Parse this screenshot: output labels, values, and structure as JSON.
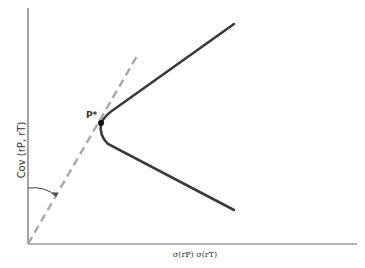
{
  "diagram": {
    "y_axis_label": "Cov (rP, rT)",
    "x_axis_label": "σ(rP) σ(rT)",
    "point_label": "P*",
    "colors": {
      "axis": "#555555",
      "curve": "#3a3a3a",
      "dashed_line": "#a8a8a8",
      "point": "#111111",
      "text": "#333333"
    },
    "elements": [
      {
        "type": "axis",
        "name": "y-axis",
        "from": [
          28,
          8
        ],
        "to": [
          28,
          244
        ]
      },
      {
        "type": "axis",
        "name": "x-axis",
        "from": [
          28,
          244
        ],
        "to": [
          357,
          244
        ]
      },
      {
        "type": "dashed-line",
        "name": "tangent-ray",
        "from": [
          28,
          244
        ],
        "to": [
          137,
          56
        ]
      },
      {
        "type": "curve",
        "name": "upper-branch",
        "from": [
          101,
          123
        ],
        "to": [
          234,
          24
        ]
      },
      {
        "type": "curve",
        "name": "lower-branch",
        "from": [
          101,
          123
        ],
        "via": [
          104,
          142
        ],
        "to": [
          234,
          210
        ]
      },
      {
        "type": "point",
        "name": "P*",
        "at": [
          101,
          123
        ]
      },
      {
        "type": "angle-arc",
        "name": "angle-marker",
        "from": [
          28,
          188
        ],
        "to": [
          56,
          197
        ]
      }
    ]
  }
}
